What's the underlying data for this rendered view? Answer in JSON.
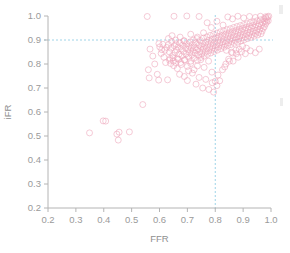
{
  "figure": {
    "name": "ffr-ifr-scatter",
    "background": "#ffffff"
  },
  "colors": {
    "point_stroke": "#efa8bc",
    "reference_line": "#9fd4e8",
    "axis": "#b4b4b4",
    "tick_text": "#9a9a9a",
    "axis_title": "#8f8f8f"
  },
  "chart_data": {
    "type": "scatter",
    "title": "",
    "xlabel": "FFR",
    "ylabel": "iFR",
    "xlim": [
      0.2,
      1.0
    ],
    "ylim": [
      0.2,
      1.0
    ],
    "grid": false,
    "legend": "none",
    "xticks": [
      "0.2",
      "0.3",
      "0.4",
      "0.5",
      "0.6",
      "0.7",
      "0.8",
      "0.9",
      "1.0"
    ],
    "yticks": [
      "0.2",
      "0.3",
      "0.4",
      "0.5",
      "0.6",
      "0.7",
      "0.8",
      "0.9",
      "1.0"
    ],
    "xtick_values": [
      0.2,
      0.3,
      0.4,
      0.5,
      0.6,
      0.7,
      0.8,
      0.9,
      1.0
    ],
    "ytick_values": [
      0.2,
      0.3,
      0.4,
      0.5,
      0.6,
      0.7,
      0.8,
      0.9,
      1.0
    ],
    "marker": "open-circle",
    "marker_size": 3.0,
    "annotations": [
      {
        "name": "ffr-cutoff-line",
        "type": "vline",
        "x": 0.8,
        "style": "dotted",
        "color": "#9fd4e8"
      },
      {
        "name": "ifr-cutoff-line",
        "type": "hline",
        "y": 0.9,
        "style": "dotted",
        "color": "#9fd4e8"
      }
    ],
    "series": [
      {
        "name": "paired FFR / iFR measurements",
        "color": "#efa8bc",
        "points": [
          [
            0.349,
            0.513
          ],
          [
            0.398,
            0.563
          ],
          [
            0.407,
            0.562
          ],
          [
            0.447,
            0.508
          ],
          [
            0.452,
            0.483
          ],
          [
            0.455,
            0.516
          ],
          [
            0.492,
            0.517
          ],
          [
            0.54,
            0.631
          ],
          [
            0.556,
            0.998
          ],
          [
            0.56,
            0.776
          ],
          [
            0.563,
            0.742
          ],
          [
            0.566,
            0.862
          ],
          [
            0.576,
            0.833
          ],
          [
            0.583,
            0.8
          ],
          [
            0.592,
            0.757
          ],
          [
            0.597,
            0.733
          ],
          [
            0.601,
            0.871
          ],
          [
            0.606,
            0.844
          ],
          [
            0.612,
            0.882
          ],
          [
            0.616,
            0.828
          ],
          [
            0.619,
            0.857
          ],
          [
            0.622,
            0.806
          ],
          [
            0.626,
            0.869
          ],
          [
            0.629,
            0.734
          ],
          [
            0.632,
            0.88
          ],
          [
            0.635,
            0.851
          ],
          [
            0.638,
            0.823
          ],
          [
            0.641,
            0.866
          ],
          [
            0.644,
            0.893
          ],
          [
            0.647,
            0.836
          ],
          [
            0.65,
            0.812
          ],
          [
            0.653,
            0.876
          ],
          [
            0.656,
            0.848
          ],
          [
            0.659,
            0.884
          ],
          [
            0.662,
            0.858
          ],
          [
            0.664,
            0.822
          ],
          [
            0.667,
            0.871
          ],
          [
            0.67,
            0.841
          ],
          [
            0.673,
            0.888
          ],
          [
            0.676,
            0.806
          ],
          [
            0.678,
            0.863
          ],
          [
            0.681,
            0.834
          ],
          [
            0.683,
            0.879
          ],
          [
            0.686,
            0.852
          ],
          [
            0.688,
            0.897
          ],
          [
            0.69,
            0.818
          ],
          [
            0.693,
            0.868
          ],
          [
            0.695,
            0.842
          ],
          [
            0.697,
            0.884
          ],
          [
            0.7,
            0.731
          ],
          [
            0.702,
            0.86
          ],
          [
            0.704,
            0.829
          ],
          [
            0.706,
            0.875
          ],
          [
            0.708,
            0.847
          ],
          [
            0.71,
            0.892
          ],
          [
            0.712,
            0.812
          ],
          [
            0.714,
            0.866
          ],
          [
            0.716,
            0.838
          ],
          [
            0.718,
            0.881
          ],
          [
            0.72,
            0.853
          ],
          [
            0.722,
            0.9
          ],
          [
            0.724,
            0.824
          ],
          [
            0.726,
            0.87
          ],
          [
            0.728,
            0.845
          ],
          [
            0.73,
            0.888
          ],
          [
            0.732,
            0.858
          ],
          [
            0.734,
            0.906
          ],
          [
            0.736,
            0.816
          ],
          [
            0.738,
            0.864
          ],
          [
            0.74,
            0.836
          ],
          [
            0.742,
            0.879
          ],
          [
            0.744,
            0.852
          ],
          [
            0.746,
            0.898
          ],
          [
            0.748,
            0.827
          ],
          [
            0.75,
            0.872
          ],
          [
            0.752,
            0.843
          ],
          [
            0.754,
            0.886
          ],
          [
            0.756,
            0.861
          ],
          [
            0.758,
            0.908
          ],
          [
            0.76,
            0.833
          ],
          [
            0.762,
            0.876
          ],
          [
            0.764,
            0.849
          ],
          [
            0.766,
            0.892
          ],
          [
            0.768,
            0.866
          ],
          [
            0.77,
            0.913
          ],
          [
            0.772,
            0.84
          ],
          [
            0.774,
            0.882
          ],
          [
            0.776,
            0.855
          ],
          [
            0.778,
            0.899
          ],
          [
            0.78,
            0.871
          ],
          [
            0.782,
            0.919
          ],
          [
            0.784,
            0.846
          ],
          [
            0.786,
            0.888
          ],
          [
            0.788,
            0.861
          ],
          [
            0.79,
            0.904
          ],
          [
            0.792,
            0.877
          ],
          [
            0.794,
            0.924
          ],
          [
            0.796,
            0.852
          ],
          [
            0.798,
            0.893
          ],
          [
            0.8,
            0.866
          ],
          [
            0.802,
            0.91
          ],
          [
            0.804,
            0.882
          ],
          [
            0.806,
            0.929
          ],
          [
            0.808,
            0.858
          ],
          [
            0.81,
            0.899
          ],
          [
            0.812,
            0.872
          ],
          [
            0.814,
            0.915
          ],
          [
            0.816,
            0.888
          ],
          [
            0.818,
            0.934
          ],
          [
            0.82,
            0.864
          ],
          [
            0.822,
            0.905
          ],
          [
            0.824,
            0.878
          ],
          [
            0.826,
            0.92
          ],
          [
            0.828,
            0.893
          ],
          [
            0.83,
            0.938
          ],
          [
            0.832,
            0.87
          ],
          [
            0.834,
            0.91
          ],
          [
            0.836,
            0.884
          ],
          [
            0.838,
            0.925
          ],
          [
            0.84,
            0.898
          ],
          [
            0.842,
            0.943
          ],
          [
            0.844,
            0.876
          ],
          [
            0.846,
            0.915
          ],
          [
            0.848,
            0.889
          ],
          [
            0.85,
            0.93
          ],
          [
            0.852,
            0.903
          ],
          [
            0.854,
            0.947
          ],
          [
            0.856,
            0.881
          ],
          [
            0.858,
            0.92
          ],
          [
            0.86,
            0.894
          ],
          [
            0.862,
            0.935
          ],
          [
            0.864,
            0.908
          ],
          [
            0.866,
            0.952
          ],
          [
            0.868,
            0.886
          ],
          [
            0.87,
            0.925
          ],
          [
            0.872,
            0.899
          ],
          [
            0.874,
            0.939
          ],
          [
            0.876,
            0.913
          ],
          [
            0.878,
            0.956
          ],
          [
            0.88,
            0.891
          ],
          [
            0.882,
            0.93
          ],
          [
            0.884,
            0.904
          ],
          [
            0.886,
            0.944
          ],
          [
            0.888,
            0.918
          ],
          [
            0.89,
            0.96
          ],
          [
            0.892,
            0.896
          ],
          [
            0.894,
            0.934
          ],
          [
            0.896,
            0.909
          ],
          [
            0.898,
            0.948
          ],
          [
            0.9,
            0.922
          ],
          [
            0.902,
            0.964
          ],
          [
            0.904,
            0.901
          ],
          [
            0.906,
            0.939
          ],
          [
            0.908,
            0.913
          ],
          [
            0.91,
            0.952
          ],
          [
            0.912,
            0.927
          ],
          [
            0.914,
            0.968
          ],
          [
            0.916,
            0.906
          ],
          [
            0.918,
            0.943
          ],
          [
            0.92,
            0.918
          ],
          [
            0.922,
            0.956
          ],
          [
            0.924,
            0.931
          ],
          [
            0.926,
            0.972
          ],
          [
            0.928,
            0.911
          ],
          [
            0.93,
            0.948
          ],
          [
            0.932,
            0.922
          ],
          [
            0.934,
            0.96
          ],
          [
            0.936,
            0.936
          ],
          [
            0.938,
            0.976
          ],
          [
            0.94,
            0.916
          ],
          [
            0.942,
            0.952
          ],
          [
            0.944,
            0.927
          ],
          [
            0.946,
            0.964
          ],
          [
            0.948,
            0.94
          ],
          [
            0.95,
            0.98
          ],
          [
            0.952,
            0.921
          ],
          [
            0.954,
            0.957
          ],
          [
            0.956,
            0.932
          ],
          [
            0.958,
            0.968
          ],
          [
            0.96,
            0.945
          ],
          [
            0.962,
            0.984
          ],
          [
            0.964,
            0.926
          ],
          [
            0.966,
            0.961
          ],
          [
            0.968,
            0.937
          ],
          [
            0.97,
            0.972
          ],
          [
            0.972,
            0.949
          ],
          [
            0.974,
            0.988
          ],
          [
            0.976,
            0.955
          ],
          [
            0.978,
            0.978
          ],
          [
            0.98,
            0.966
          ],
          [
            0.982,
            0.992
          ],
          [
            0.984,
            0.974
          ],
          [
            0.986,
            0.985
          ],
          [
            0.988,
            0.996
          ],
          [
            0.99,
            0.98
          ],
          [
            0.992,
            0.999
          ],
          [
            0.636,
            0.816
          ],
          [
            0.651,
            0.793
          ],
          [
            0.664,
            0.781
          ],
          [
            0.672,
            0.757
          ],
          [
            0.689,
            0.748
          ],
          [
            0.704,
            0.772
          ],
          [
            0.718,
            0.762
          ],
          [
            0.731,
            0.716
          ],
          [
            0.742,
            0.744
          ],
          [
            0.755,
            0.7
          ],
          [
            0.766,
            0.736
          ],
          [
            0.777,
            0.694
          ],
          [
            0.789,
            0.722
          ],
          [
            0.794,
            0.683
          ],
          [
            0.806,
            0.71
          ],
          [
            0.816,
            0.73
          ],
          [
            0.826,
            0.776
          ],
          [
            0.838,
            0.8
          ],
          [
            0.851,
            0.812
          ],
          [
            0.862,
            0.846
          ],
          [
            0.874,
            0.858
          ],
          [
            0.886,
            0.862
          ],
          [
            0.898,
            0.874
          ],
          [
            0.912,
            0.866
          ],
          [
            0.652,
            0.999
          ],
          [
            0.698,
            1.0
          ],
          [
            0.742,
            0.998
          ],
          [
            0.771,
            0.972
          ],
          [
            0.786,
            0.952
          ],
          [
            0.806,
            0.978
          ],
          [
            0.828,
            0.962
          ],
          [
            0.845,
            0.996
          ],
          [
            0.862,
            0.988
          ],
          [
            0.881,
            0.999
          ],
          [
            0.902,
            0.992
          ],
          [
            0.923,
            0.998
          ],
          [
            0.944,
            0.994
          ],
          [
            0.962,
            0.999
          ],
          [
            0.981,
            0.997
          ],
          [
            0.632,
            0.906
          ],
          [
            0.645,
            0.918
          ],
          [
            0.658,
            0.9
          ],
          [
            0.674,
            0.912
          ],
          [
            0.688,
            0.896
          ],
          [
            0.712,
            0.924
          ],
          [
            0.736,
            0.912
          ],
          [
            0.758,
            0.93
          ],
          [
            0.598,
            0.885
          ],
          [
            0.608,
            0.86
          ],
          [
            0.84,
            0.857
          ],
          [
            0.858,
            0.849
          ],
          [
            0.876,
            0.843
          ],
          [
            0.894,
            0.851
          ],
          [
            0.908,
            0.843
          ],
          [
            0.926,
            0.855
          ],
          [
            0.944,
            0.847
          ],
          [
            0.958,
            0.862
          ],
          [
            0.848,
            0.82
          ],
          [
            0.864,
            0.812
          ],
          [
            0.882,
            0.828
          ],
          [
            0.834,
            0.788
          ],
          [
            0.81,
            0.754
          ],
          [
            0.8,
            0.728
          ],
          [
            0.788,
            0.766
          ],
          [
            0.776,
            0.812
          ],
          [
            0.76,
            0.786
          ],
          [
            0.748,
            0.818
          ],
          [
            0.736,
            0.792
          ],
          [
            0.724,
            0.776
          ],
          [
            0.712,
            0.802
          ],
          [
            0.7,
            0.79
          ],
          [
            0.69,
            0.816
          ],
          [
            0.678,
            0.798
          ],
          [
            0.668,
            0.82
          ],
          [
            0.658,
            0.806
          ],
          [
            0.648,
            0.826
          ],
          [
            0.64,
            0.802
          ]
        ]
      }
    ]
  },
  "edge_artifacts": [
    {
      "name": "page-edge-mark-top",
      "x": 279,
      "y": 5,
      "w": 4,
      "h": 9
    },
    {
      "name": "page-edge-mark-middle",
      "x": 280,
      "y": 98,
      "w": 3,
      "h": 8
    }
  ]
}
